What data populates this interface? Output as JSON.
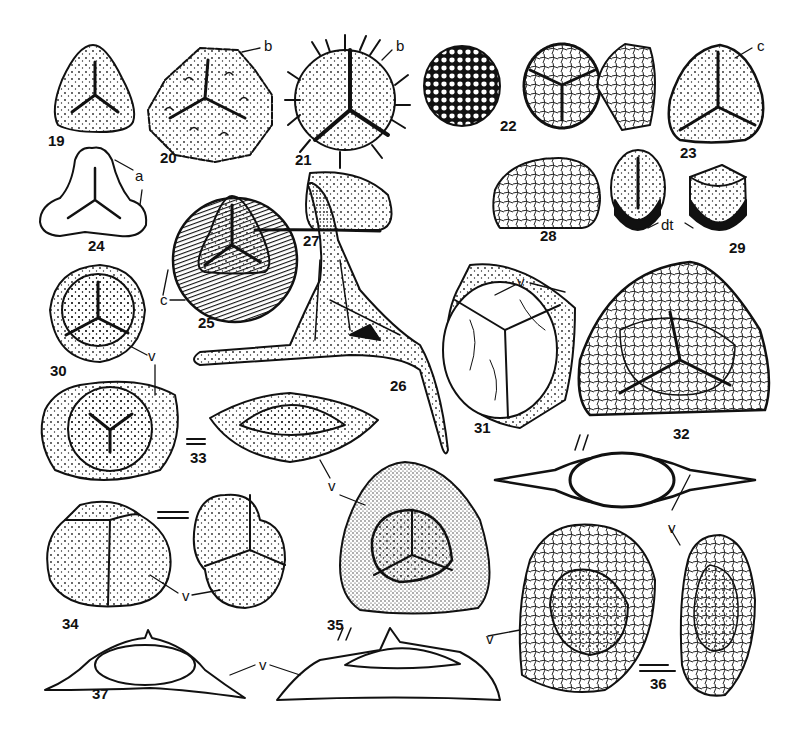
{
  "figure": {
    "type": "scientific plate of spore illustrations (line drawings)",
    "background": "#ffffff",
    "ink": "#111111"
  },
  "specimens": [
    {
      "number": "19",
      "label_pos": [
        48,
        395
      ],
      "shape": "rounded triangle, trilete mark, smooth"
    },
    {
      "number": "20",
      "label_pos": [
        160,
        150
      ],
      "shape": "rounded triangle, trilete mark, verrucate/ornamented"
    },
    {
      "number": "21",
      "label_pos": [
        295,
        150
      ],
      "shape": "circular, trilete mark, long spines"
    },
    {
      "number": "22",
      "label_pos": [
        500,
        117
      ],
      "shape": "three views: reticulate sphere, trilete with zona, lateral view"
    },
    {
      "number": "23",
      "label_pos": [
        680,
        145
      ],
      "shape": "rounded triangle, trilete with cingulum"
    },
    {
      "number": "24",
      "label_pos": [
        88,
        235
      ],
      "shape": "lobed triangle, trilete, thickened apices"
    },
    {
      "number": "25",
      "label_pos": [
        198,
        313
      ],
      "shape": "circular with striate equatorial zone, trilete"
    },
    {
      "number": "26",
      "label_pos": [
        390,
        383
      ],
      "shape": "triangular with three long appendages"
    },
    {
      "number": "27",
      "label_pos": [
        275,
        235
      ],
      "shape": "semicircular lateral view, punctate"
    },
    {
      "number": "28",
      "label_pos": [
        545,
        228
      ],
      "shape": "semicircular lateral view, verrucate"
    },
    {
      "number": "29",
      "label_pos": [
        729,
        238
      ],
      "shape": "two views, monolete/trilete with dark base"
    },
    {
      "number": "30",
      "label_pos": [
        50,
        365
      ],
      "shape": "circular cavate, trilete"
    },
    {
      "number": "31",
      "label_pos": [
        474,
        420
      ],
      "shape": "irregular vesicle with folds"
    },
    {
      "number": "32",
      "label_pos": [
        673,
        425
      ],
      "shape": "triangular, reticulate, trilete with cavate zone"
    },
    {
      "number": "33",
      "label_pos": [
        190,
        448
      ],
      "shape": "oval cavate proximal view and lateral view"
    },
    {
      "number": "34",
      "label_pos": [
        62,
        618
      ],
      "shape": "tetrad, two views"
    },
    {
      "number": "35",
      "label_pos": [
        327,
        617
      ],
      "shape": "rounded triangle cavate, trilete"
    },
    {
      "number": "36",
      "label_pos": [
        650,
        668
      ],
      "shape": "oval cavate with vesicle, two views"
    },
    {
      "number": "37",
      "label_pos": [
        92,
        686
      ],
      "shape": "lateral section with wing"
    }
  ],
  "annotations": [
    {
      "text": "b",
      "pos": [
        264,
        45
      ],
      "meaning": "ornament"
    },
    {
      "text": "b",
      "pos": [
        396,
        45
      ]
    },
    {
      "text": "a",
      "pos": [
        135,
        175
      ]
    },
    {
      "text": "c",
      "pos": [
        757,
        42
      ]
    },
    {
      "text": "c",
      "pos": [
        160,
        298
      ]
    },
    {
      "text": "dt",
      "pos": [
        667,
        223
      ]
    },
    {
      "text": "v",
      "pos": [
        150,
        353
      ]
    },
    {
      "text": "v",
      "pos": [
        517,
        281
      ]
    },
    {
      "text": "v",
      "pos": [
        335,
        484
      ]
    },
    {
      "text": "v",
      "pos": [
        182,
        589
      ]
    },
    {
      "text": "v",
      "pos": [
        261,
        660
      ]
    },
    {
      "text": "v",
      "pos": [
        486,
        633
      ]
    },
    {
      "text": "v",
      "pos": [
        670,
        518
      ]
    },
    {
      "text": "v",
      "pos": [
        346,
        515
      ]
    }
  ],
  "symbols": {
    "equivalence_bars": [
      "between 33 views",
      "between 34 views",
      "between 36 views"
    ],
    "double_slash": [
      "near 32 section",
      "near 35 section"
    ]
  }
}
